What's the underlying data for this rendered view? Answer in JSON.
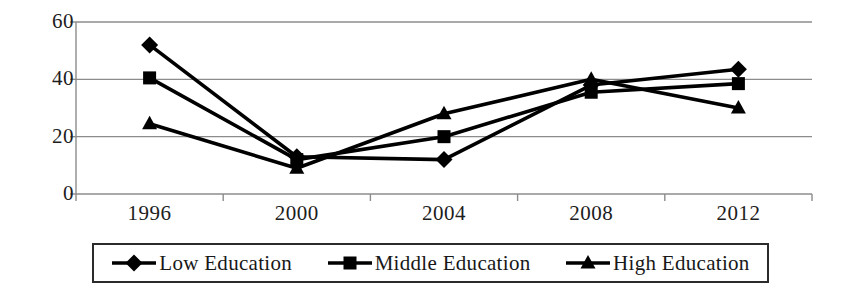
{
  "chart_data": {
    "type": "line",
    "title": "",
    "xlabel": "",
    "ylabel": "",
    "categories": [
      "1996",
      "2000",
      "2004",
      "2008",
      "2012"
    ],
    "x_tick_labels": [
      "1996",
      "2000",
      "2004",
      "2008",
      "2012"
    ],
    "y_tick_labels": [
      "60",
      "40",
      "20",
      "0"
    ],
    "ylim": [
      0,
      60
    ],
    "y_ticks": [
      0,
      20,
      40,
      60
    ],
    "grid": "horizontal",
    "legend_position": "bottom",
    "series": [
      {
        "name": "Low Education",
        "marker": "diamond",
        "values": [
          52,
          13,
          12,
          38,
          43.5
        ]
      },
      {
        "name": "Middle Education",
        "marker": "square",
        "values": [
          40.5,
          12,
          20,
          35.5,
          38.5
        ]
      },
      {
        "name": "High Education",
        "marker": "triangle",
        "values": [
          24.5,
          9,
          28,
          40,
          30
        ]
      }
    ]
  },
  "legend": {
    "entries": [
      {
        "label": "Low Education",
        "marker": "diamond-marker-icon"
      },
      {
        "label": "Middle Education",
        "marker": "square-marker-icon"
      },
      {
        "label": "High Education",
        "marker": "triangle-marker-icon"
      }
    ]
  },
  "style": {
    "series_color": "#000000",
    "grid_color": "#8c8c8c",
    "axis_color": "#8c8c8c",
    "legend_border_color": "#2b2b2b",
    "background": "#ffffff"
  }
}
